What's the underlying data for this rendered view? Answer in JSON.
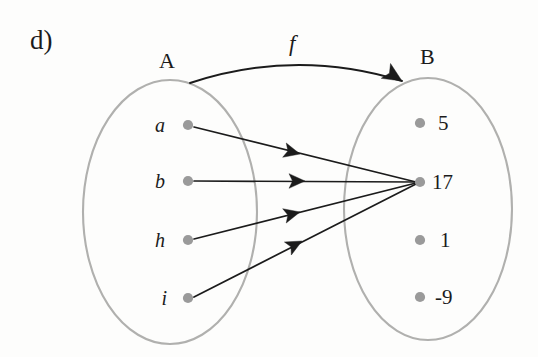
{
  "figure": {
    "part_label": "d)",
    "function_name": "f",
    "background_color": "#fdfdfc",
    "ellipse_stroke": "#b0b0ae",
    "dot_color": "#9a9a9a",
    "arrow_color": "#1b1b1b",
    "text_color": "#1b1b1b"
  },
  "domain": {
    "name": "A",
    "label_x": 165,
    "label_y": 62,
    "ellipse": {
      "cx": 170,
      "cy": 212,
      "rx": 87,
      "ry": 132
    },
    "elements": [
      {
        "label": "a",
        "dot_x": 188,
        "dot_y": 125,
        "label_x": 165,
        "label_y": 125
      },
      {
        "label": "b",
        "dot_x": 188,
        "dot_y": 181,
        "label_x": 165,
        "label_y": 181
      },
      {
        "label": "h",
        "dot_x": 188,
        "dot_y": 240,
        "label_x": 165,
        "label_y": 240
      },
      {
        "label": "i",
        "dot_x": 188,
        "dot_y": 298,
        "label_x": 167,
        "label_y": 298
      }
    ]
  },
  "codomain": {
    "name": "B",
    "label_x": 426,
    "label_y": 58,
    "ellipse": {
      "cx": 428,
      "cy": 209,
      "rx": 84,
      "ry": 131
    },
    "elements": [
      {
        "label": "5",
        "dot_x": 420,
        "dot_y": 123,
        "label_x": 438,
        "label_y": 123
      },
      {
        "label": "17",
        "dot_x": 420,
        "dot_y": 182,
        "label_x": 432,
        "label_y": 182
      },
      {
        "label": "1",
        "dot_x": 420,
        "dot_y": 240,
        "label_x": 440,
        "label_y": 240
      },
      {
        "label": "-9",
        "dot_x": 420,
        "dot_y": 297,
        "label_x": 435,
        "label_y": 297
      }
    ]
  },
  "function_arc": {
    "label": "f",
    "label_x": 295,
    "label_y": 45,
    "start_x": 190,
    "start_y": 83,
    "control_x": 296,
    "control_y": 48,
    "end_x": 402,
    "end_y": 81,
    "arrowhead_x": 402,
    "arrowhead_y": 81,
    "arrowhead_angle": 32
  },
  "mappings": [
    {
      "from": "a",
      "to": "17",
      "x1": 194,
      "y1": 127,
      "x2": 416,
      "y2": 182,
      "arrow_x": 300,
      "arrow_y": 154,
      "arrow_angle": 14
    },
    {
      "from": "b",
      "to": "17",
      "x1": 194,
      "y1": 181,
      "x2": 416,
      "y2": 182,
      "arrow_x": 305,
      "arrow_y": 181,
      "arrow_angle": 0
    },
    {
      "from": "h",
      "to": "17",
      "x1": 194,
      "y1": 239,
      "x2": 416,
      "y2": 183,
      "arrow_x": 300,
      "arrow_y": 212,
      "arrow_angle": -14
    },
    {
      "from": "i",
      "to": "17",
      "x1": 194,
      "y1": 297,
      "x2": 416,
      "y2": 184,
      "arrow_x": 302,
      "arrow_y": 241,
      "arrow_angle": -28
    }
  ],
  "chart_data": {
    "type": "diagram",
    "title": "d)",
    "diagram_kind": "function-mapping-venn",
    "function_name": "f",
    "domain_set": {
      "name": "A",
      "members": [
        "a",
        "b",
        "h",
        "i"
      ]
    },
    "codomain_set": {
      "name": "B",
      "members": [
        "5",
        "17",
        "1",
        "-9"
      ]
    },
    "edges": [
      {
        "source": "a",
        "target": "17"
      },
      {
        "source": "b",
        "target": "17"
      },
      {
        "source": "h",
        "target": "17"
      },
      {
        "source": "i",
        "target": "17"
      }
    ],
    "unmapped_codomain_members": [
      "5",
      "1",
      "-9"
    ]
  }
}
